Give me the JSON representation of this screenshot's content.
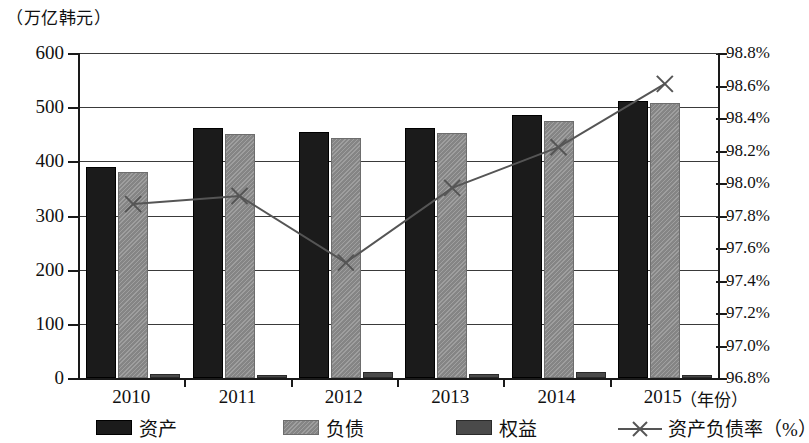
{
  "chart_data": {
    "type": "bar",
    "title": "",
    "subtitle": "",
    "unit_caption": "（万亿韩元）",
    "xlabel": "（年份）",
    "ylabel": "",
    "categories": [
      "2010",
      "2011",
      "2012",
      "2013",
      "2014",
      "2015"
    ],
    "left_axis": {
      "ticks": [
        "600",
        "500",
        "400",
        "300",
        "200",
        "100",
        "0"
      ],
      "tick_values": [
        600,
        500,
        400,
        300,
        200,
        100,
        0
      ],
      "ylim": [
        0,
        600
      ],
      "unit": "（万亿韩元）"
    },
    "right_axis": {
      "ticks": [
        "98.8%",
        "98.6%",
        "98.4%",
        "98.2%",
        "98.0%",
        "97.8%",
        "97.6%",
        "97.4%",
        "97.2%",
        "97.0%",
        "96.8%"
      ],
      "tick_values": [
        98.8,
        98.6,
        98.4,
        98.2,
        98.0,
        97.8,
        97.6,
        97.4,
        97.2,
        97.0,
        96.8
      ],
      "ylim": [
        96.8,
        98.8
      ],
      "unit": "%"
    },
    "grid": true,
    "legend_position": "bottom",
    "series": [
      {
        "name": "资产",
        "type": "bar",
        "axis": "left",
        "color": "#1b1b1b",
        "values": [
          390,
          461,
          455,
          461,
          485,
          512
        ]
      },
      {
        "name": "负债",
        "type": "bar",
        "axis": "left",
        "color": "#8d8d8d",
        "values": [
          381,
          450,
          444,
          453,
          474,
          508
        ]
      },
      {
        "name": "权益",
        "type": "bar",
        "axis": "left",
        "color": "#4a4a4a",
        "values": [
          7,
          6,
          11,
          8,
          11,
          6
        ]
      },
      {
        "name": "资产负债率（%）",
        "type": "line",
        "axis": "right",
        "marker": "x",
        "color": "#555555",
        "values": [
          97.87,
          97.92,
          97.51,
          97.97,
          98.22,
          98.61
        ]
      }
    ]
  },
  "legend": {
    "items": [
      {
        "label": "资产",
        "swatch": "bar-swatch-asset"
      },
      {
        "label": "负债",
        "swatch": "bar-swatch-liability"
      },
      {
        "label": "权益",
        "swatch": "bar-swatch-equity"
      },
      {
        "label": "资产负债率（%）",
        "swatch": "line-swatch-ratio"
      }
    ]
  },
  "axes": {
    "left_ticks": [
      "600",
      "500",
      "400",
      "300",
      "200",
      "100",
      "0"
    ],
    "right_ticks": [
      "98.8%",
      "98.6%",
      "98.4%",
      "98.2%",
      "98.0%",
      "97.8%",
      "97.6%",
      "97.4%",
      "97.2%",
      "97.0%",
      "96.8%"
    ],
    "x_ticks": [
      "2010",
      "2011",
      "2012",
      "2013",
      "2014",
      "2015"
    ],
    "x_unit": "（年份）",
    "y_unit": "（万亿韩元）"
  }
}
